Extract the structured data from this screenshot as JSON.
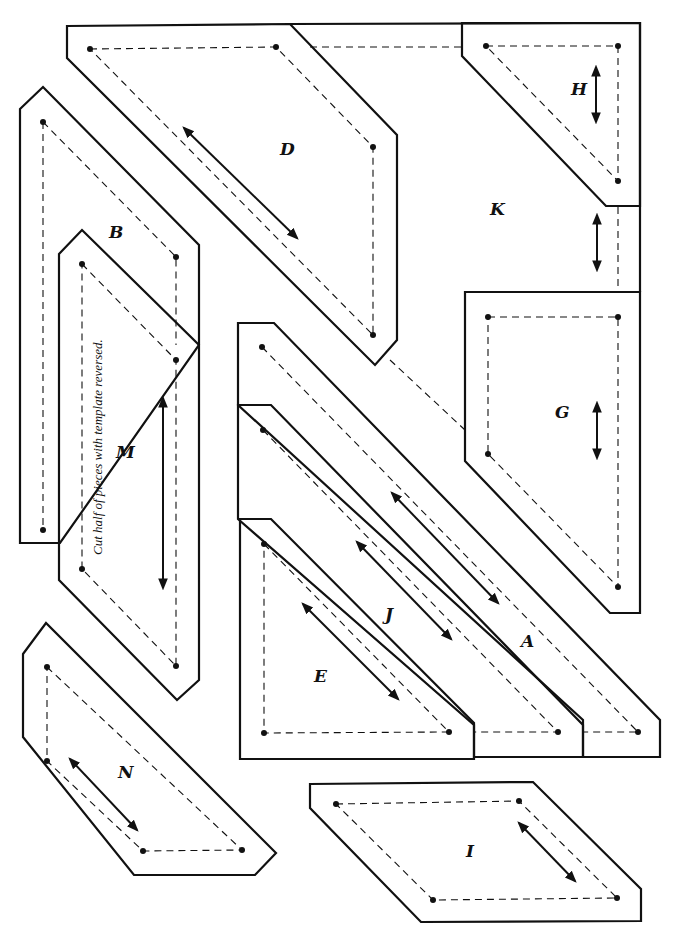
{
  "pieces": {
    "A": {
      "label": "A"
    },
    "B": {
      "label": "B"
    },
    "D": {
      "label": "D"
    },
    "E": {
      "label": "E"
    },
    "G": {
      "label": "G"
    },
    "H": {
      "label": "H"
    },
    "I": {
      "label": "I"
    },
    "J": {
      "label": "J"
    },
    "K": {
      "label": "K"
    },
    "M": {
      "label": "M",
      "note": "Cut half of pieces with template reversed."
    },
    "N": {
      "label": "N"
    }
  },
  "legend": {
    "solid_line": "cutting line",
    "dashed_line": "seam line",
    "arrow": "grain line"
  }
}
